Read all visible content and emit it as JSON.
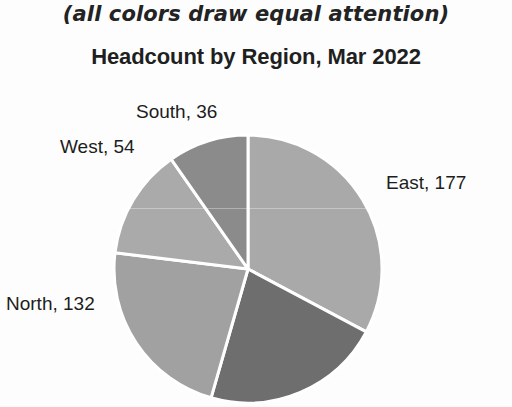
{
  "chart_data": {
    "type": "pie",
    "title": "Headcount by Region, Mar 2022",
    "subtitle": "(all colors draw equal attention)",
    "xlabel": "",
    "ylabel": "",
    "grid": false,
    "legend": "none",
    "label_format": "{name}, {value}",
    "total": 399,
    "start_angle_deg": 0,
    "direction": "clockwise",
    "categories": [
      "East",
      "Unlabeled",
      "North",
      "West",
      "South"
    ],
    "values": [
      177,
      97,
      132,
      54,
      36
    ],
    "labels": [
      "East, 177",
      "",
      "North, 132",
      "West, 54",
      "South, 36"
    ],
    "colors": [
      "#a9a9a9",
      "#6e6e6e",
      "#a1a1a1",
      "#aaaaaa",
      "#8b8b8b"
    ],
    "slices": [
      {
        "name": "East",
        "value": 177,
        "label": "East, 177",
        "color": "#a9a9a9",
        "start_deg": 0,
        "end_deg": 118
      },
      {
        "name": "",
        "value": 97,
        "label": "",
        "color": "#6e6e6e",
        "start_deg": 118,
        "end_deg": 196
      },
      {
        "name": "North",
        "value": 132,
        "label": "North, 132",
        "color": "#a1a1a1",
        "start_deg": 196,
        "end_deg": 277
      },
      {
        "name": "West",
        "value": 54,
        "label": "West, 54",
        "color": "#aaaaaa",
        "start_deg": 277,
        "end_deg": 325
      },
      {
        "name": "South",
        "value": 36,
        "label": "South, 36",
        "color": "#8b8b8b",
        "start_deg": 325,
        "end_deg": 360
      }
    ],
    "geometry": {
      "center_x": 248,
      "center_y": 269,
      "radius": 134,
      "separator_color": "#ffffff",
      "separator_width": 3
    },
    "background_color": "#fdfdfd",
    "title_color": "#1f1f1f",
    "label_color": "#1d1d1d"
  }
}
